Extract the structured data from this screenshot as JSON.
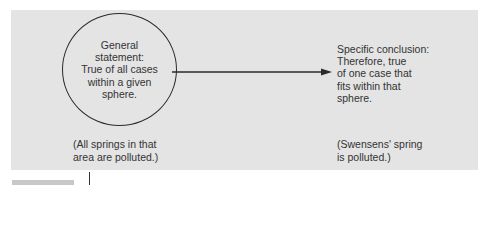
{
  "diagram": {
    "type": "deductive-reasoning-flow",
    "panel_color": "#e4e4e4",
    "general_statement": {
      "shape": "circle",
      "lines": [
        "General",
        "statement:",
        "True of all cases",
        "within a given",
        "sphere."
      ]
    },
    "arrow": {
      "from": "general_statement",
      "to": "specific_conclusion",
      "direction": "right"
    },
    "specific_conclusion": {
      "lines": [
        "Specific conclusion:",
        "Therefore, true",
        "of one case that",
        "fits within that",
        "sphere."
      ]
    },
    "example_general": {
      "lines": [
        "(All springs in that",
        "area are polluted.)"
      ]
    },
    "example_specific": {
      "lines": [
        "(Swensens' spring",
        "is polluted.)"
      ]
    }
  }
}
